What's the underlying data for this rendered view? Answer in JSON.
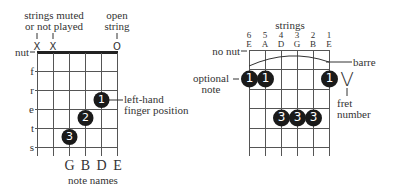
{
  "left_diagram": {
    "annotation_muted": [
      "strings muted",
      "or not played"
    ],
    "annotation_open": [
      "open",
      "string"
    ],
    "string_markers": [
      "X",
      "X",
      "",
      "",
      "",
      "O"
    ],
    "nut_label": "nut",
    "fret_labels": [
      "f",
      "r",
      "e",
      "t",
      "s"
    ],
    "fingers": [
      {
        "string": 5,
        "fret": 3,
        "label": "1"
      },
      {
        "string": 4,
        "fret": 4,
        "label": "2"
      },
      {
        "string": 3,
        "fret": 5,
        "label": "3"
      }
    ],
    "finger_annotation": [
      "left-hand",
      "finger position"
    ],
    "note_names": [
      "G",
      "B",
      "D",
      "E"
    ],
    "note_names_caption": "note names"
  },
  "right_diagram": {
    "strings_caption": "strings",
    "string_numbers": [
      "6",
      "5",
      "4",
      "3",
      "2",
      "1"
    ],
    "string_names": [
      "E",
      "A",
      "D",
      "G",
      "B",
      "E"
    ],
    "no_nut_label": "no nut",
    "barre_label": "barre",
    "optional_note_label": [
      "optional",
      "note"
    ],
    "fret_number": "V",
    "fret_number_caption": [
      "fret",
      "number"
    ],
    "fingers": [
      {
        "string": 1,
        "fret": 1,
        "label": "1"
      },
      {
        "string": 2,
        "fret": 1,
        "label": "1"
      },
      {
        "string": 6,
        "fret": 1,
        "label": "1"
      },
      {
        "string": 3,
        "fret": 3,
        "label": "3"
      },
      {
        "string": 4,
        "fret": 3,
        "label": "3"
      },
      {
        "string": 5,
        "fret": 3,
        "label": "3"
      }
    ]
  }
}
